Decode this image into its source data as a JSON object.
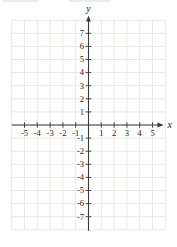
{
  "chart_data": {
    "type": "scatter",
    "series": [],
    "title": "",
    "xlabel": "x",
    "ylabel": "y",
    "x_axis": {
      "label": "x",
      "grid_range": [
        -6,
        6
      ],
      "tick_values": [
        -5,
        -4,
        -3,
        -2,
        -1,
        1,
        2,
        3,
        4,
        5
      ],
      "tick_labels": [
        "-5",
        "-4",
        "-3",
        "-2",
        "-1",
        "1",
        "2",
        "3",
        "4",
        "5"
      ],
      "arrow": "positive-end-only"
    },
    "y_axis": {
      "label": "y",
      "grid_range": [
        -8,
        8
      ],
      "tick_values": [
        7,
        6,
        5,
        4,
        3,
        2,
        1,
        -1,
        -2,
        -3,
        -4,
        -5,
        -6,
        -7
      ],
      "tick_labels": [
        "7",
        "6",
        "5",
        "4",
        "3",
        "2",
        "1",
        "-1",
        "-2",
        "-3",
        "-4",
        "-5",
        "-6",
        "-7"
      ],
      "arrow": "positive-end-only"
    },
    "grid": true,
    "legend": false,
    "colors": {
      "background": "#ffffff",
      "gridline": "#e2e0da",
      "axis": "#3a3a3a",
      "tick": "#3a3a3a",
      "label": "#262626"
    }
  }
}
